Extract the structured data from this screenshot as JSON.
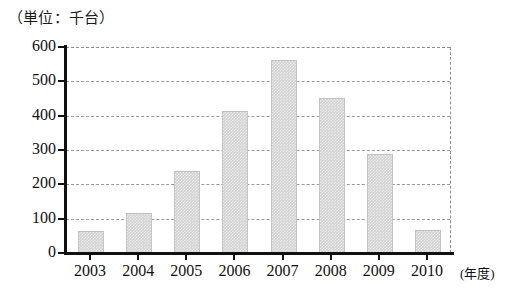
{
  "chart_data": {
    "type": "bar",
    "title": "（単位：千台）",
    "subtitle": "",
    "xlabel": "(年度)",
    "ylabel": "",
    "categories": [
      "2003",
      "2004",
      "2005",
      "2006",
      "2007",
      "2008",
      "2009",
      "2010"
    ],
    "values": [
      60,
      115,
      235,
      410,
      560,
      450,
      285,
      65
    ],
    "series": [
      {
        "name": "",
        "values": [
          60,
          115,
          235,
          410,
          560,
          450,
          285,
          65
        ]
      }
    ],
    "ylim": [
      0,
      600
    ],
    "yticks": [
      0,
      100,
      200,
      300,
      400,
      500,
      600
    ],
    "ytick_labels": [
      "0",
      "100",
      "200",
      "300",
      "400",
      "500",
      "600"
    ],
    "grid": true,
    "grid_axis": "y",
    "legend": false,
    "legend_position": "none",
    "bar_color": "#d2d2d2",
    "axis_color": "#111111",
    "grid_color": "#9a9a9a",
    "background": "#ffffff"
  },
  "caption": {
    "unit_note": "（単位：千台）"
  },
  "axis": {
    "x_unit_label": "(年度)"
  }
}
